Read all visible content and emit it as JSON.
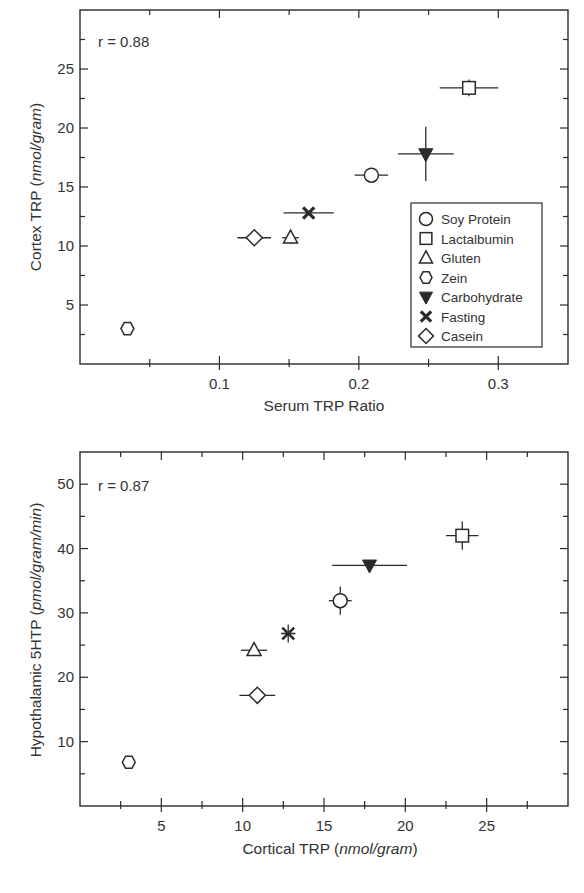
{
  "chart_data": [
    {
      "type": "scatter",
      "title": "",
      "annotation": "r = 0.88",
      "xlabel": "Serum TRP Ratio",
      "ylabel": "Cortex TRP (nmol/gram)",
      "ylabel_main": "Cortex TRP ",
      "ylabel_unit": "nmol/gram",
      "xlim": [
        0,
        0.35
      ],
      "ylim": [
        0,
        30
      ],
      "xticks": [
        "0.1",
        "0.2",
        "0.3"
      ],
      "yticks": [
        "5",
        "10",
        "15",
        "20",
        "25"
      ],
      "grid": false,
      "legend_position": "inside-right",
      "points": [
        {
          "name": "Soy Protein",
          "marker": "circle",
          "x": 0.209,
          "y": 16.0,
          "xerr": 0.012,
          "yerr": 0.0
        },
        {
          "name": "Lactalbumin",
          "marker": "square",
          "x": 0.279,
          "y": 23.4,
          "xerr": 0.021,
          "yerr": 0.7
        },
        {
          "name": "Gluten",
          "marker": "triangle-up",
          "x": 0.151,
          "y": 10.7,
          "xerr": 0.006,
          "yerr": 0.5
        },
        {
          "name": "Zein",
          "marker": "hexagon",
          "x": 0.034,
          "y": 3.0,
          "xerr": 0.0,
          "yerr": 0.0
        },
        {
          "name": "Carbohydrate",
          "marker": "triangle-down-filled",
          "x": 0.248,
          "y": 17.8,
          "xerr": 0.02,
          "yerr": 2.3
        },
        {
          "name": "Fasting",
          "marker": "x-bold",
          "x": 0.164,
          "y": 12.8,
          "xerr": 0.018,
          "yerr": 0.0
        },
        {
          "name": "Casein",
          "marker": "diamond",
          "x": 0.125,
          "y": 10.7,
          "xerr": 0.012,
          "yerr": 0.0
        }
      ]
    },
    {
      "type": "scatter",
      "title": "",
      "annotation": "r = 0.87",
      "xlabel": "Cortical TRP (nmol/gram)",
      "xlabel_main": "Cortical TRP (",
      "xlabel_unit": "nmol/gram",
      "xlabel_close": ")",
      "ylabel": "Hypothalamic 5HTP (pmol/gram/min)",
      "ylabel_main": "Hypothalamic 5HTP ",
      "ylabel_unit": "pmol/gram/min",
      "xlim": [
        0,
        30
      ],
      "ylim": [
        0,
        55
      ],
      "xticks": [
        "5",
        "10",
        "15",
        "20",
        "25"
      ],
      "yticks": [
        "10",
        "20",
        "30",
        "40",
        "50"
      ],
      "grid": false,
      "points": [
        {
          "name": "Soy Protein",
          "marker": "circle",
          "x": 16.0,
          "y": 31.9,
          "xerr": 0.7,
          "yerr": 2.2
        },
        {
          "name": "Lactalbumin",
          "marker": "square",
          "x": 23.5,
          "y": 42.0,
          "xerr": 1.0,
          "yerr": 2.2
        },
        {
          "name": "Gluten",
          "marker": "triangle-up",
          "x": 10.7,
          "y": 24.2,
          "xerr": 0.8,
          "yerr": 0.6
        },
        {
          "name": "Zein",
          "marker": "hexagon",
          "x": 3.0,
          "y": 6.8,
          "xerr": 0.0,
          "yerr": 0.6
        },
        {
          "name": "Carbohydrate",
          "marker": "triangle-down-filled",
          "x": 17.8,
          "y": 37.4,
          "xerr": 2.3,
          "yerr": 0.0
        },
        {
          "name": "Fasting",
          "marker": "asterisk",
          "x": 12.8,
          "y": 26.8,
          "xerr": 0.0,
          "yerr": 1.4
        },
        {
          "name": "Casein",
          "marker": "diamond",
          "x": 10.9,
          "y": 17.2,
          "xerr": 1.1,
          "yerr": 0.0
        }
      ]
    }
  ],
  "legend": {
    "items": [
      {
        "label": "Soy Protein",
        "marker": "circle"
      },
      {
        "label": "Lactalbumin",
        "marker": "square"
      },
      {
        "label": "Gluten",
        "marker": "triangle-up"
      },
      {
        "label": "Zein",
        "marker": "hexagon"
      },
      {
        "label": "Carbohydrate",
        "marker": "triangle-down-filled"
      },
      {
        "label": "Fasting",
        "marker": "x-bold"
      },
      {
        "label": "Casein",
        "marker": "diamond"
      }
    ]
  },
  "colors": {
    "ink": "#2a2a2a",
    "background": "#ffffff"
  }
}
